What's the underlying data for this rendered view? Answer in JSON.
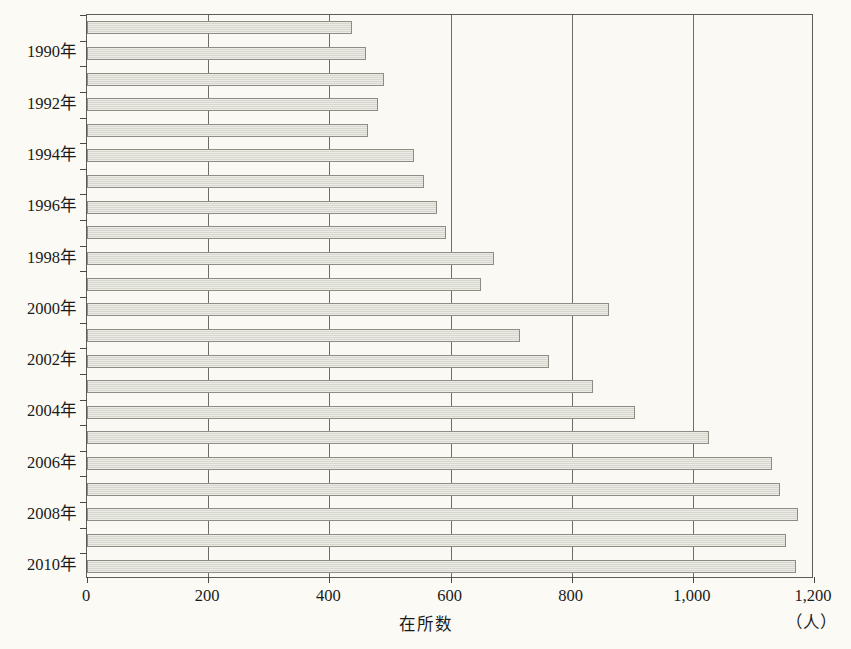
{
  "chart_data": {
    "type": "bar",
    "orientation": "horizontal",
    "title": "",
    "xlabel": "在所数",
    "ylabel": "",
    "unit_label": "（人）",
    "xlim": [
      0,
      1200
    ],
    "xticks": [
      0,
      200,
      400,
      600,
      800,
      1000,
      1200
    ],
    "xtick_labels": [
      "0",
      "200",
      "400",
      "600",
      "800",
      "1,000",
      "1,200"
    ],
    "grid": "vertical",
    "legend": "none",
    "bar_fill_color": "#dddcd2",
    "bar_border_color": "#8d8d82",
    "background_color": "#faf9f3",
    "axis_color": "#5c5c54",
    "categories": [
      "1989年",
      "1990年",
      "1991年",
      "1992年",
      "1993年",
      "1994年",
      "1995年",
      "1996年",
      "1997年",
      "1998年",
      "1999年",
      "2000年",
      "2001年",
      "2002年",
      "2003年",
      "2004年",
      "2005年",
      "2006年",
      "2007年",
      "2008年",
      "2009年",
      "2010年"
    ],
    "ytick_labels_shown": [
      "1990年",
      "1992年",
      "1994年",
      "1996年",
      "1998年",
      "2000年",
      "2002年",
      "2004年",
      "2006年",
      "2008年",
      "2010年"
    ],
    "values": [
      438,
      461,
      490,
      481,
      463,
      539,
      557,
      578,
      593,
      671,
      650,
      861,
      714,
      762,
      835,
      904,
      1026,
      1130,
      1144,
      1174,
      1154,
      1170
    ]
  }
}
